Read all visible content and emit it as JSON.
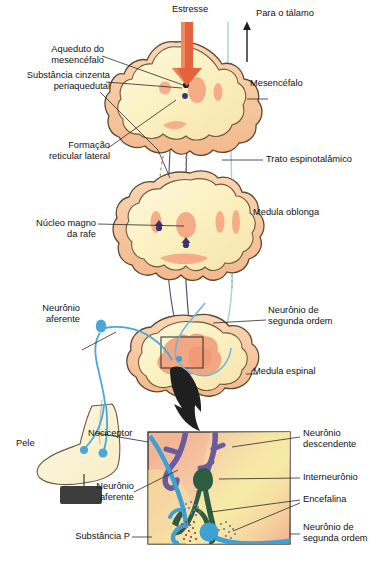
{
  "figure": {
    "language": "pt-BR",
    "caption": ""
  },
  "labels": {
    "estresse": "Estresse",
    "para_talamo": "Para o tálamo",
    "aqueduto": "Aqueduto do\nmesencéfalo",
    "substancia_cinzenta": "Substância cinzenta\nperiaquedutal",
    "mesencefalo": "Mesencéfalo",
    "formacao_reticular": "Formação\nreticular lateral",
    "trato_espinotalamico": "Trato espinotalâmico",
    "nucleo_magno": "Núcleo magno\nda rafe",
    "medula_oblonga": "Medula oblonga",
    "neuronio_aferente_top": "Neurônio\naferente",
    "neuronio_segunda_ordem_top": "Neurônio de\nsegunda ordem",
    "medula_espinal": "Medula espinal",
    "pele": "Pele",
    "nociceptor": "Nociceptor",
    "neuronio_aferente_inset": "Neurônio\naferente",
    "substancia_p": "Substância P",
    "neuronio_descendente": "Neurônio\ndescendente",
    "interneuronio": "Interneurônio",
    "encefalina": "Encefalina",
    "neuronio_segunda_ordem_inset": "Neurônio de\nsegunda ordem"
  },
  "colors": {
    "stress_arrow": "#e4633c",
    "stress_arrow_dark": "#c8482a",
    "tissue_cream": "#fbf2c9",
    "tissue_cream_light": "#fdf8e3",
    "tissue_rim": "#f6c9a0",
    "gray_matter": "#f3a683",
    "outline": "#5a4a33",
    "afferent_blue": "#4aa8d8",
    "descending_purple": "#6a5b9e",
    "interneuron_green": "#2e5c41",
    "spinothalamic_blue": "#9ecfe0",
    "tract_navy": "#4a4a6a",
    "leader": "#2b2b2b",
    "stimulus_block": "#3d3d3d",
    "inset_bg_peach": "#f6bd9b",
    "inset_bg_yellow": "#f5e9a8",
    "substance_p_dot": "#8a3a6a",
    "enkephalin_dot": "#6a7aa8"
  },
  "structures": {
    "midbrain": "Mesencéfalo (corte transversal)",
    "medulla": "Medula oblonga (corte transversal)",
    "spinal_cord": "Medula espinal (corte transversal)",
    "inset": "Detalhe do corno dorsal",
    "foot": "Pé / pele com nociceptores"
  }
}
